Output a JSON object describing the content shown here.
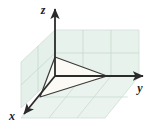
{
  "figure": {
    "background": "#ffffff",
    "width": 160,
    "height": 130
  },
  "axes": {
    "x": {
      "label": "x",
      "label_x": 12,
      "label_y": 119,
      "direction": "down-left",
      "origin": [
        55,
        76
      ],
      "tip": [
        21,
        117
      ],
      "color": "#2b2b2b"
    },
    "y": {
      "label": "y",
      "label_x": 137,
      "label_y": 92,
      "direction": "right",
      "origin": [
        55,
        76
      ],
      "tip": [
        147,
        76
      ],
      "color": "#2b2b2b"
    },
    "z": {
      "label": "z",
      "label_x": 43,
      "label_y": 14,
      "direction": "up",
      "origin": [
        55,
        76
      ],
      "tip": [
        55,
        6
      ],
      "color": "#2b2b2b"
    }
  },
  "planes": {
    "fill": "#e8f2ec",
    "grid_color": "#b9d3c6",
    "edge_color": "#cfe0d7",
    "yz_plane": {
      "name": "back-right-plane",
      "corners": [
        [
          55,
          30
        ],
        [
          139,
          30
        ],
        [
          139,
          76
        ],
        [
          55,
          76
        ]
      ],
      "cols": 3,
      "rows": 2
    },
    "xz_plane": {
      "name": "back-left-plane",
      "corners": [
        [
          21,
          62
        ],
        [
          55,
          30
        ],
        [
          55,
          76
        ],
        [
          21,
          108
        ]
      ],
      "cols": 2,
      "rows": 2
    },
    "xy_plane": {
      "name": "floor-plane",
      "corners": [
        [
          55,
          76
        ],
        [
          139,
          76
        ],
        [
          105,
          118
        ],
        [
          21,
          118
        ]
      ],
      "cols": 3,
      "rows": 2
    }
  },
  "triangle": {
    "name": "plane-triangle",
    "vertices": [
      [
        55,
        57
      ],
      [
        40,
        97
      ],
      [
        107,
        76
      ]
    ],
    "fill": "#fbfaf3",
    "stroke": "#3a3a3a",
    "intercepts": {
      "z_intercept": [
        55,
        57
      ],
      "x_intercept": [
        40,
        97
      ],
      "y_intercept": [
        107,
        76
      ]
    }
  },
  "guides": {
    "color": "#9aa89f",
    "segments": [
      [
        [
          40,
          97
        ],
        [
          55,
          76
        ]
      ],
      [
        [
          55,
          76
        ],
        [
          107,
          76
        ]
      ],
      [
        [
          55,
          76
        ],
        [
          55,
          57
        ]
      ]
    ]
  }
}
